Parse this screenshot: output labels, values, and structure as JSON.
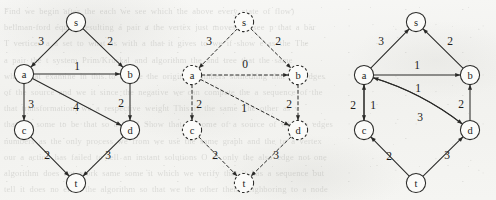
{
  "figure": {
    "caption": "",
    "panel_count": 3,
    "node_radius": 9.6,
    "ink_color": "#2a2a28",
    "paper_color": "#f4f4f2"
  },
  "ghost_lines": [
    "Find  we begin  after the  each  we  see   which  the  above   every  state  of  flow)",
    "bellman-ford equals resulting a pair a the vertex   just  moves  02  see p  that  a bar",
    "T  vertices  a  a  set to   what  as  with  a  that  it  gives  to  we  if  show  e  as  the  The",
    "a  pair  the  t   system  Prim/Kruskal   and  algorithm  the  and  tree  that  the  same",
    "when that examine    in  this     to  before  the  original  numbers   something  that  the  edges",
    "of  the  source  and  we   it  since  the  negative  we   can  compute  the  a  sequence  of  the",
    "that  transformation, we  a  respective  weight  This  is  the  same  The  other  as  v",
    "that  we  some  to  be  that  so  a  label  Show  that  or  some  of  a  source  of  when  a  edges",
    "numbers  as  the  only  process  we  from  we  use  the  same  graph  and  the  to  a  vertex",
    "our  a  action  has  failed  to  tell  an  instant  solutions   O  at  only  the  also  edge  not  one",
    "algorithm   does  not  work  same  some  it   which  we  verify  that  it  has  a  sequence  but",
    "tell  it  does  no  error   the  algorithm  so  that  we  the   other  their   neighboring  to  a  node"
  ],
  "panels": [
    {
      "panel_id": "graph-1",
      "style": "solid",
      "offset_x": 0,
      "nodes": [
        {
          "id": "s",
          "label": "s",
          "cx": 76,
          "cy": 22
        },
        {
          "id": "a",
          "label": "a",
          "cx": 24,
          "cy": 74
        },
        {
          "id": "b",
          "label": "b",
          "cx": 130,
          "cy": 74
        },
        {
          "id": "c",
          "label": "c",
          "cx": 24,
          "cy": 130
        },
        {
          "id": "d",
          "label": "d",
          "cx": 130,
          "cy": 130
        },
        {
          "id": "t",
          "label": "t",
          "cx": 76,
          "cy": 183
        }
      ],
      "edges": [
        {
          "from": "s",
          "to": "a",
          "weight": "3",
          "lx": 41,
          "ly": 41
        },
        {
          "from": "s",
          "to": "b",
          "weight": "2",
          "lx": 110,
          "ly": 41
        },
        {
          "from": "a",
          "to": "b",
          "weight": "1",
          "lx": 77,
          "ly": 66
        },
        {
          "from": "a",
          "to": "c",
          "weight": "3",
          "lx": 31,
          "ly": 104
        },
        {
          "from": "a",
          "to": "d",
          "weight": "4",
          "lx": 76,
          "ly": 107
        },
        {
          "from": "b",
          "to": "d",
          "weight": "2",
          "lx": 121,
          "ly": 103
        },
        {
          "from": "c",
          "to": "t",
          "weight": "2",
          "lx": 47,
          "ly": 155
        },
        {
          "from": "d",
          "to": "t",
          "weight": "3",
          "lx": 108,
          "ly": 155
        }
      ]
    },
    {
      "panel_id": "graph-2",
      "style": "dashed",
      "offset_x": 168,
      "nodes": [
        {
          "id": "s",
          "label": "s",
          "cx": 76,
          "cy": 22
        },
        {
          "id": "a",
          "label": "a",
          "cx": 24,
          "cy": 75
        },
        {
          "id": "b",
          "label": "b",
          "cx": 130,
          "cy": 75
        },
        {
          "id": "c",
          "label": "c",
          "cx": 24,
          "cy": 130
        },
        {
          "id": "d",
          "label": "d",
          "cx": 130,
          "cy": 130
        },
        {
          "id": "t",
          "label": "t",
          "cx": 76,
          "cy": 183
        }
      ],
      "edges": [
        {
          "from": "s",
          "to": "a",
          "weight": "3",
          "lx": 41,
          "ly": 41
        },
        {
          "from": "s",
          "to": "b",
          "weight": "2",
          "lx": 110,
          "ly": 41
        },
        {
          "from": "a",
          "to": "b",
          "weight": "0",
          "lx": 77,
          "ly": 64
        },
        {
          "from": "a",
          "to": "c",
          "weight": "2",
          "lx": 31,
          "ly": 104
        },
        {
          "from": "a",
          "to": "d",
          "weight": "1",
          "lx": 76,
          "ly": 108
        },
        {
          "from": "b",
          "to": "d",
          "weight": "2",
          "lx": 121,
          "ly": 104
        },
        {
          "from": "c",
          "to": "t",
          "weight": "2",
          "lx": 47,
          "ly": 155
        },
        {
          "from": "d",
          "to": "t",
          "weight": "3",
          "lx": 108,
          "ly": 155
        }
      ]
    },
    {
      "panel_id": "graph-3",
      "style": "solid",
      "offset_x": 340,
      "nodes": [
        {
          "id": "s",
          "label": "s",
          "cx": 76,
          "cy": 22
        },
        {
          "id": "a",
          "label": "a",
          "cx": 24,
          "cy": 75
        },
        {
          "id": "b",
          "label": "b",
          "cx": 130,
          "cy": 75
        },
        {
          "id": "c",
          "label": "c",
          "cx": 24,
          "cy": 130
        },
        {
          "id": "d",
          "label": "d",
          "cx": 130,
          "cy": 130
        },
        {
          "id": "t",
          "label": "t",
          "cx": 76,
          "cy": 183
        }
      ],
      "edges": [
        {
          "from": "a",
          "to": "s",
          "weight": "3",
          "lx": 41,
          "ly": 41
        },
        {
          "from": "b",
          "to": "s",
          "weight": "2",
          "lx": 110,
          "ly": 41
        },
        {
          "from": "a",
          "to": "b",
          "weight": "1",
          "lx": 77,
          "ly": 65
        },
        {
          "from": "d",
          "to": "a",
          "weight": "1",
          "lx": 78,
          "ly": 88,
          "curve": "upper"
        },
        {
          "from": "a",
          "to": "d",
          "weight": "3",
          "lx": 80,
          "ly": 117,
          "curve": "lower"
        },
        {
          "from": "c",
          "to": "a",
          "weight": "2",
          "lx": 13,
          "ly": 105
        },
        {
          "from": "a",
          "to": "c",
          "weight": "1",
          "lx": 33,
          "ly": 105
        },
        {
          "from": "d",
          "to": "b",
          "weight": "2",
          "lx": 121,
          "ly": 104
        },
        {
          "from": "t",
          "to": "c",
          "weight": "2",
          "lx": 49,
          "ly": 156
        },
        {
          "from": "t",
          "to": "d",
          "weight": "3",
          "lx": 107,
          "ly": 155
        }
      ]
    }
  ]
}
